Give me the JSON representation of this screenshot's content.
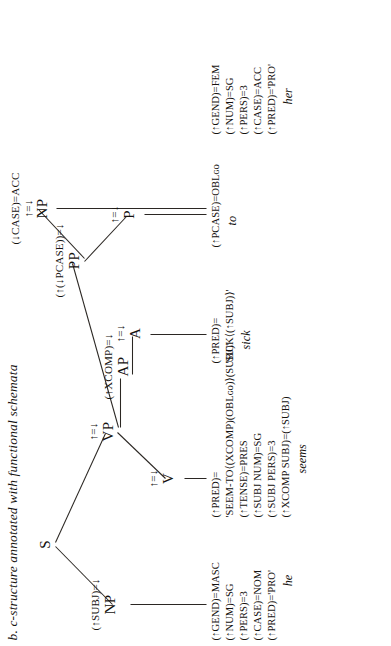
{
  "caption": "b. c-structure annotated with functional schemata",
  "colors": {
    "ink": "#15120f",
    "line": "#2b2723",
    "background": "#ffffff"
  },
  "tree": {
    "root": {
      "category": "S",
      "schema": ""
    },
    "nodes": [
      {
        "id": "s",
        "category": "S",
        "schema": ""
      },
      {
        "id": "np_subj",
        "category": "NP",
        "schema": "(↑SUBJ)=↓"
      },
      {
        "id": "vp",
        "category": "VP",
        "schema": "↑=↓"
      },
      {
        "id": "v",
        "category": "V",
        "schema": "↑=↓"
      },
      {
        "id": "ap",
        "category": "AP",
        "schema": "(↑XCOMP)=↓"
      },
      {
        "id": "a",
        "category": "A",
        "schema": "↑=↓"
      },
      {
        "id": "pp",
        "category": "PP",
        "schema": "(↑(↓PCASE))=↓"
      },
      {
        "id": "p",
        "category": "P",
        "schema": "↑=↓"
      },
      {
        "id": "np_obj",
        "category": "NP",
        "schema_case": "(↓CASE)=ACC",
        "schema": "↑=↓"
      }
    ]
  },
  "leaves": {
    "he": {
      "word": "he",
      "features": [
        "(↑GEND)=MASC",
        "(↑NUM)=SG",
        "(↑PERS)=3",
        "(↑CASE)=NOM",
        "(↑PRED)='PRO'"
      ]
    },
    "seems": {
      "word": "seems",
      "features": [
        "(↑PRED)=",
        "'SEEM-TO⟨(XCOMP)(OBLɢᴏ)⟩(SUBJ)'",
        "(↑TENSE)=PRES",
        "(↑SUBJ NUM)=SG",
        "(↑SUBJ PERS)=3",
        "(↑XCOMP SUBJ)=(↑SUBJ)"
      ]
    },
    "sick": {
      "word": "sick",
      "features": [
        "(↑PRED)=",
        "'SICK⟨(↑SUBJ)⟩'"
      ]
    },
    "to": {
      "word": "to",
      "features": [
        "(↑PCASE)=OBLɢᴏ"
      ]
    },
    "her": {
      "word": "her",
      "features": [
        "(↑GEND)=FEM",
        "(↑NUM)=SG",
        "(↑PERS)=3",
        "(↑CASE)=ACC",
        "(↑PRED)='PRO'"
      ]
    }
  }
}
